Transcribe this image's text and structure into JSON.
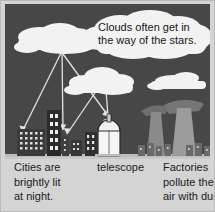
{
  "figure": {
    "colors": {
      "page_background": "#d4d4d4",
      "sky": "#474747",
      "ground": "#c9c9c9",
      "cloud": "#f2f2f2",
      "light_ray": "#e0e0e0",
      "building_dark": "#2b2b2b",
      "building_mid": "#555555",
      "window_lit": "#e8e8e8",
      "observatory": "#f5f5f5",
      "factory": "#8a8a8a",
      "smoke": "#6e6e6e",
      "text": "#1b1b1b",
      "border": "#b9b9b9"
    }
  },
  "cloud_caption": {
    "name": "clouds-callout",
    "lines": [
      "Clouds often get in",
      "the way of the stars."
    ]
  },
  "captions": [
    {
      "id": "cities",
      "name": "caption-cities",
      "lines": [
        "Cities are",
        "brightly lit",
        "at night."
      ]
    },
    {
      "id": "telescope",
      "name": "caption-telescope",
      "lines": [
        "telescope"
      ]
    },
    {
      "id": "factories",
      "name": "caption-factories",
      "lines": [
        "Factories",
        "pollute the",
        "air with dust."
      ]
    }
  ],
  "scene_elements": {
    "clouds": [
      {
        "name": "cloud-upper-left",
        "label": "cloud"
      },
      {
        "name": "cloud-caption-top",
        "label": "cloud"
      },
      {
        "name": "cloud-middle",
        "label": "cloud"
      },
      {
        "name": "cloud-right",
        "label": "cloud"
      }
    ],
    "light_rays": {
      "name": "light-ray-arrows",
      "count": 5,
      "label": "light rays from city reflecting off clouds"
    },
    "city": {
      "name": "city-buildings",
      "label": "lit city skyline"
    },
    "observatory": {
      "name": "telescope-dome",
      "label": "observatory dome"
    },
    "factory": {
      "name": "factory-towers",
      "label": "factory smokestacks with dust"
    }
  }
}
